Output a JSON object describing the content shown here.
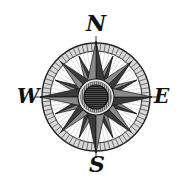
{
  "image": {
    "subject": "compass-rose",
    "width": 185,
    "height": 190
  },
  "compass": {
    "center": [
      96,
      97
    ],
    "outer_radius": 54,
    "inner_ring_radius": 45,
    "hub_radius": 18,
    "hub_inner_radius": 12,
    "points": 16,
    "colors": {
      "ink": "#111111",
      "dark_fill": "#3a3a3a",
      "mid_fill": "#8a8a8a",
      "light_fill": "#cfcfcf",
      "paper": "#ffffff"
    }
  },
  "labels": {
    "north": "N",
    "west": "W",
    "east": "E",
    "south": "S"
  }
}
